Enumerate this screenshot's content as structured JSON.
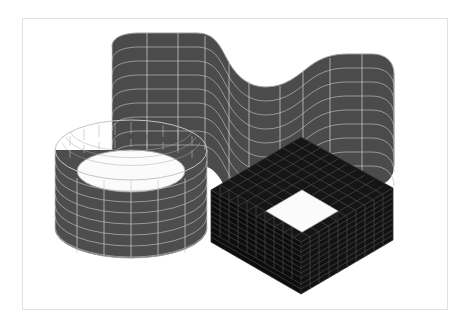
{
  "figure": {
    "title": "",
    "background_color": "#ffffff",
    "frame_border_color": "#e2e2e2",
    "frame": {
      "x": 22,
      "y": 18,
      "width": 426,
      "height": 292
    }
  },
  "scene": {
    "description": "Three meshed thin-shell finite-element geometries rendered in isometric-like 3D: an open circular cylindrical shell, a doubly-curved S-shaped (sinusoidal) extruded wall panel, and a hollow square box section.",
    "projection": "isometric",
    "objects": [
      {
        "id": "cylinder-shell",
        "name": "circular-cylindrical-shell",
        "label": "Cylindrical shell",
        "fill_color": "#4d4d4d",
        "inner_fill_color": "#3a3a3a",
        "mesh_line_color": "#b9b9b9",
        "mesh_rings": 9,
        "mesh_columns": 24,
        "center_x": 131,
        "center_y": 186,
        "radius_x": 76,
        "radius_y": 30,
        "height": 108
      },
      {
        "id": "wavy-shell",
        "name": "sinusoidal-curved-wall-shell",
        "label": "S-curved extruded shell",
        "fill_color": "#4b4b4b",
        "mesh_line_color": "#bcbcbc",
        "mesh_rows": 9,
        "mesh_columns": 20,
        "top_left_x": 112,
        "top_left_y": 33,
        "height": 120
      },
      {
        "id": "box-shell",
        "name": "hollow-square-box-shell",
        "label": "Hollow box section",
        "fill_color": "#0f0f0f",
        "mesh_line_color": "#4a4a4a",
        "top_face_hole_color": "#fbfbfb",
        "mesh_rows": 10,
        "mesh_columns": 10,
        "left_corner_x": 211,
        "left_corner_y": 190,
        "right_corner_x": 393,
        "right_corner_y": 188,
        "front_corner_x": 301,
        "front_corner_y": 242,
        "back_corner_x": 301,
        "back_corner_y": 137,
        "wall_height": 52
      }
    ]
  },
  "colors": {
    "background": "#ffffff",
    "mid_gray_shell": "#4d4d4d",
    "dark_shell": "#0f0f0f",
    "mesh_light": "#bcbcbc",
    "mesh_dark": "#4a4a4a",
    "frame_border": "#e2e2e2"
  }
}
